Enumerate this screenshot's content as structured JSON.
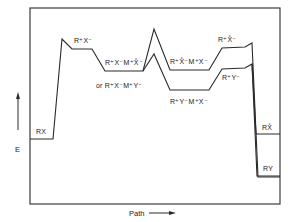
{
  "diagram": {
    "type": "energy-profile",
    "y_axis_label": "E",
    "x_axis_label": "Path",
    "stroke_color": "#2a2a2a",
    "background": "#ffffff"
  },
  "labels": {
    "rx": "RX",
    "r_x_ion_pair": "R⁺X⁻",
    "r_x_m_x_star": "R⁺X⁻M⁺X̊⁻",
    "or_r_x_m_y": "or R⁺X⁻M⁺Y⁻",
    "r_x_star_m_x": "R⁺X̊⁻M⁺X⁻",
    "r_y_m_x": "R⁺Y⁻M⁺X⁻",
    "r_x_star": "R⁺X̊⁻",
    "r_y": "R⁺Y⁻",
    "rx_star": "RX̊",
    "ry": "RY"
  }
}
